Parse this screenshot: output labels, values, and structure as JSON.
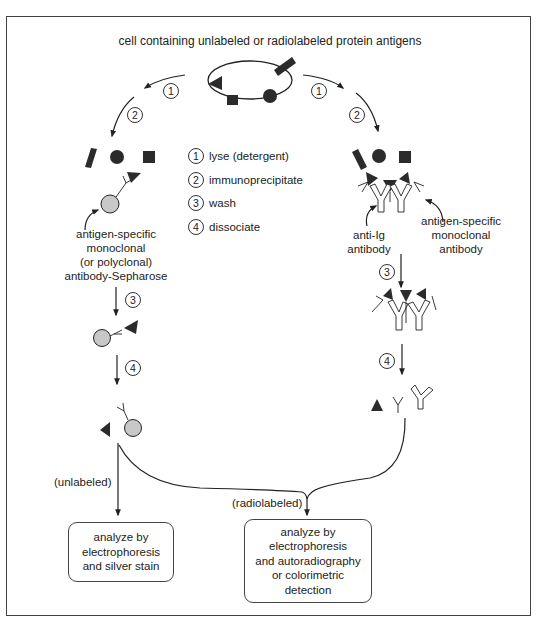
{
  "title": "cell containing unlabeled or radiolabeled protein antigens",
  "legend": [
    {
      "num": "1",
      "label": "lyse (detergent)"
    },
    {
      "num": "2",
      "label": "immunoprecipitate"
    },
    {
      "num": "3",
      "label": "wash"
    },
    {
      "num": "4",
      "label": "dissociate"
    }
  ],
  "left_branch": {
    "step1": "1",
    "step2": "2",
    "bead_label": [
      "antigen-specific",
      "monoclonal",
      "(or polyclonal)",
      "antibody-Sepharose"
    ],
    "step3": "3",
    "step4": "4",
    "path_label": "(unlabeled)",
    "result_box": [
      "analyze by",
      "electrophoresis",
      "and silver stain"
    ]
  },
  "right_branch": {
    "step1": "1",
    "step2": "2",
    "anti_ig_label": [
      "anti-Ig",
      "antibody"
    ],
    "mono_label": [
      "antigen-specific",
      "monoclonal",
      "antibody"
    ],
    "step3": "3",
    "step4": "4",
    "path_label": "(radiolabeled)",
    "result_box": [
      "analyze by",
      "electrophoresis",
      "and autoradiography",
      "or colorimetric",
      "detection"
    ]
  },
  "colors": {
    "antigen_fill": "#2b2b2b",
    "bead_fill": "#c8c8c8",
    "line": "#222222",
    "frame": "#444444"
  }
}
